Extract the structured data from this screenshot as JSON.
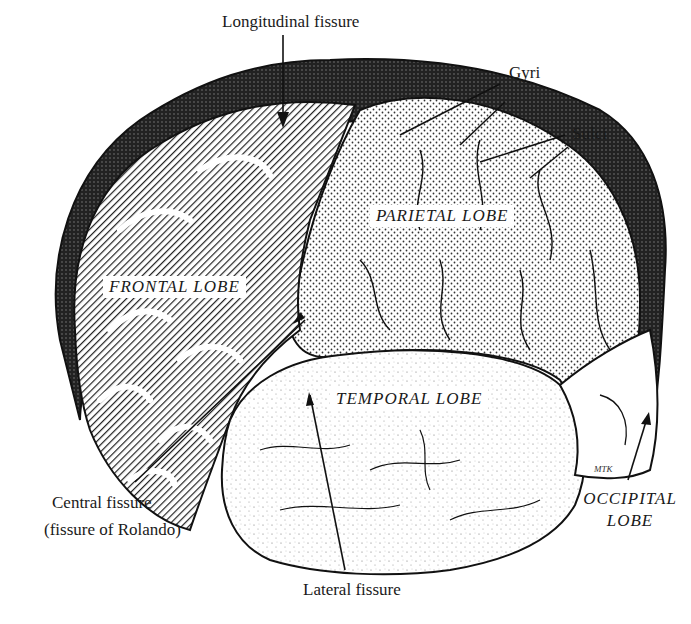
{
  "figure": {
    "labels": {
      "longitudinal_fissure": "Longitudinal fissure",
      "gyri": "Gyri",
      "sulci": "Sulci",
      "central_fissure": "Central fissure",
      "central_fissure_alt": "(fissure of Rolando)",
      "lateral_fissure": "Lateral fissure"
    },
    "lobes": {
      "frontal": "FRONTAL  LOBE",
      "parietal": "PARIETAL  LOBE",
      "temporal": "TEMPORAL  LOBE",
      "occipital_line1": "OCCIPITAL",
      "occipital_line2": "LOBE"
    },
    "artist_signature": "MTK"
  }
}
